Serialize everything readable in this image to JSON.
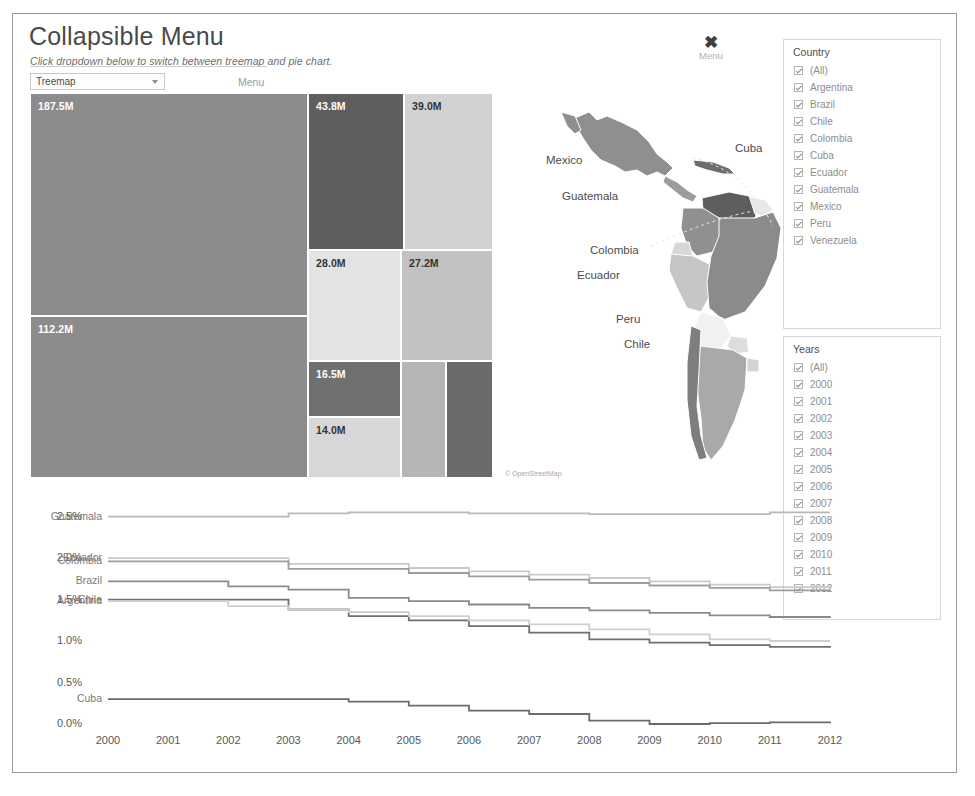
{
  "header": {
    "title": "Collapsible Menu",
    "subtitle": "Click dropdown below to switch between treemap and pie chart.",
    "dropdown_value": "Treemap",
    "dropdown_label": "Menu",
    "menu_button_label": "Menu",
    "close_icon": "close-x-icon"
  },
  "treemap": {
    "tiles": [
      {
        "label": "187.5M",
        "value": 187.5,
        "country": "Brazil",
        "color": "#8c8c8c",
        "text": "light",
        "x": 0,
        "y": 0,
        "w": 278,
        "h": 223
      },
      {
        "label": "112.2M",
        "value": 112.2,
        "country": "Mexico",
        "color": "#8c8c8c",
        "text": "light",
        "x": 0,
        "y": 223,
        "w": 278,
        "h": 162
      },
      {
        "label": "43.8M",
        "value": 43.8,
        "country": "Argentina",
        "color": "#5e5e5e",
        "text": "light",
        "x": 278,
        "y": 0,
        "w": 96,
        "h": 157
      },
      {
        "label": "39.0M",
        "value": 39.0,
        "country": "Colombia",
        "color": "#d2d2d2",
        "text": "dark",
        "x": 374,
        "y": 0,
        "w": 89,
        "h": 157
      },
      {
        "label": "28.0M",
        "value": 28.0,
        "country": "Peru",
        "color": "#e3e3e3",
        "text": "dark",
        "x": 278,
        "y": 157,
        "w": 93,
        "h": 111
      },
      {
        "label": "27.2M",
        "value": 27.2,
        "country": "Venezuela",
        "color": "#c2c2c2",
        "text": "dark",
        "x": 371,
        "y": 157,
        "w": 92,
        "h": 111
      },
      {
        "label": "16.5M",
        "value": 16.5,
        "country": "Chile",
        "color": "#707070",
        "text": "light",
        "x": 278,
        "y": 268,
        "w": 93,
        "h": 56
      },
      {
        "label": "14.0M",
        "value": 14.0,
        "country": "Ecuador",
        "color": "#d7d7d7",
        "text": "dark",
        "x": 278,
        "y": 324,
        "w": 93,
        "h": 61
      },
      {
        "label": "",
        "value": 11.2,
        "country": "Cuba",
        "color": "#b6b6b6",
        "text": "dark",
        "x": 371,
        "y": 268,
        "w": 45,
        "h": 117
      },
      {
        "label": "",
        "value": 10.8,
        "country": "Guatemala",
        "color": "#6b6b6b",
        "text": "light",
        "x": 416,
        "y": 268,
        "w": 47,
        "h": 117
      }
    ]
  },
  "map": {
    "labels": [
      {
        "name": "Mexico",
        "x": 49,
        "y": 104
      },
      {
        "name": "Cuba",
        "x": 238,
        "y": 92
      },
      {
        "name": "Guatemala",
        "x": 65,
        "y": 140
      },
      {
        "name": "Colombia",
        "x": 93,
        "y": 194
      },
      {
        "name": "Ecuador",
        "x": 80,
        "y": 219
      },
      {
        "name": "Peru",
        "x": 119,
        "y": 263
      },
      {
        "name": "Chile",
        "x": 127,
        "y": 288
      }
    ],
    "attribution": "© OpenStreetMap"
  },
  "filters": {
    "country": {
      "title": "Country",
      "items": [
        {
          "label": "(All)",
          "checked": true
        },
        {
          "label": "Argentina",
          "checked": true
        },
        {
          "label": "Brazil",
          "checked": true
        },
        {
          "label": "Chile",
          "checked": true
        },
        {
          "label": "Colombia",
          "checked": true
        },
        {
          "label": "Cuba",
          "checked": true
        },
        {
          "label": "Ecuador",
          "checked": true
        },
        {
          "label": "Guatemala",
          "checked": true
        },
        {
          "label": "Mexico",
          "checked": true
        },
        {
          "label": "Peru",
          "checked": true
        },
        {
          "label": "Venezuela",
          "checked": true
        }
      ]
    },
    "years": {
      "title": "Years",
      "items": [
        {
          "label": "(All)",
          "checked": true
        },
        {
          "label": "2000",
          "checked": true
        },
        {
          "label": "2001",
          "checked": true
        },
        {
          "label": "2002",
          "checked": true
        },
        {
          "label": "2003",
          "checked": true
        },
        {
          "label": "2004",
          "checked": true
        },
        {
          "label": "2005",
          "checked": true
        },
        {
          "label": "2006",
          "checked": true
        },
        {
          "label": "2007",
          "checked": true
        },
        {
          "label": "2008",
          "checked": true
        },
        {
          "label": "2009",
          "checked": true
        },
        {
          "label": "2010",
          "checked": true
        },
        {
          "label": "2011",
          "checked": true
        },
        {
          "label": "2012",
          "checked": true
        }
      ]
    }
  },
  "chart_data": {
    "type": "line",
    "title": "",
    "xlabel": "",
    "ylabel": "YoY Pop Growth Change",
    "ylim": [
      0.0,
      2.7
    ],
    "yticks": [
      "0.0%",
      "0.5%",
      "1.0%",
      "1.5%",
      "2.0%",
      "2.5%"
    ],
    "ytick_values": [
      0.0,
      0.5,
      1.0,
      1.5,
      2.0,
      2.5
    ],
    "xticks": [
      "2000",
      "2001",
      "2002",
      "2003",
      "2004",
      "2005",
      "2006",
      "2007",
      "2008",
      "2009",
      "2010",
      "2011",
      "2012"
    ],
    "x": [
      2000,
      2001,
      2002,
      2003,
      2004,
      2005,
      2006,
      2007,
      2008,
      2009,
      2010,
      2011,
      2012
    ],
    "grid": false,
    "legend": "inline-left-labels",
    "series": [
      {
        "name": "Guatemala",
        "color": "#b9b9b9",
        "values": [
          2.5,
          2.5,
          2.5,
          2.54,
          2.55,
          2.55,
          2.54,
          2.54,
          2.53,
          2.53,
          2.53,
          2.55,
          2.55
        ]
      },
      {
        "name": "Ecuador",
        "color": "#c9c9c9",
        "values": [
          2.0,
          2.0,
          2.0,
          1.93,
          1.93,
          1.88,
          1.84,
          1.8,
          1.76,
          1.72,
          1.68,
          1.65,
          1.63
        ]
      },
      {
        "name": "Colombia",
        "color": "#9d9d9d",
        "values": [
          1.96,
          1.96,
          1.96,
          1.87,
          1.87,
          1.82,
          1.78,
          1.74,
          1.7,
          1.67,
          1.64,
          1.61,
          1.6
        ]
      },
      {
        "name": "Brazil",
        "color": "#8a8a8a",
        "values": [
          1.72,
          1.72,
          1.66,
          1.62,
          1.52,
          1.48,
          1.44,
          1.4,
          1.37,
          1.34,
          1.31,
          1.29,
          1.3
        ]
      },
      {
        "name": "Chile",
        "color": "#6f6f6f",
        "values": [
          1.5,
          1.5,
          1.5,
          1.38,
          1.3,
          1.25,
          1.18,
          1.1,
          1.02,
          0.98,
          0.95,
          0.93,
          0.92
        ]
      },
      {
        "name": "Argentina",
        "color": "#cfcfcf",
        "values": [
          1.48,
          1.48,
          1.42,
          1.38,
          1.35,
          1.3,
          1.25,
          1.2,
          1.14,
          1.08,
          1.02,
          1.0,
          1.0
        ]
      },
      {
        "name": "Cuba",
        "color": "#6b6b6b",
        "values": [
          0.3,
          0.3,
          0.3,
          0.3,
          0.27,
          0.22,
          0.16,
          0.12,
          0.04,
          0.0,
          0.01,
          0.02,
          0.03
        ]
      }
    ]
  }
}
